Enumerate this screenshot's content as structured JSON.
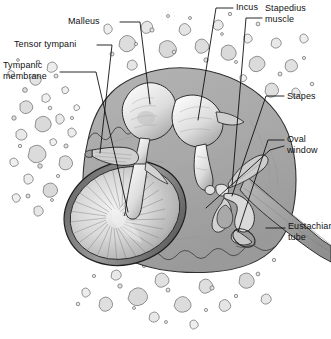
{
  "figure": {
    "width": 331,
    "height": 339,
    "background_color": "#ffffff",
    "line_color": "#111111",
    "cavity_fill": "#a9a9a9",
    "bone_fill": "#ffffff",
    "ossicle_fill": "#e8e8e8",
    "membrane_fill": "#d8d8d8"
  },
  "labels": [
    {
      "id": "tympanic-membrane",
      "text": "Tympanic\nmembrane",
      "line1": "Tympanic",
      "line2": "membrane",
      "x": 3,
      "y": 62,
      "align": "left"
    },
    {
      "id": "tensor-tympani",
      "text": "Tensor  tympani",
      "line1": "Tensor  tympani",
      "line2": "",
      "x": 14,
      "y": 41,
      "align": "left"
    },
    {
      "id": "malleus",
      "text": "Malleus",
      "line1": "Malleus",
      "line2": "",
      "x": 68,
      "y": 17,
      "align": "left"
    },
    {
      "id": "incus",
      "text": "Incus",
      "line1": "Incus",
      "line2": "",
      "x": 236,
      "y": 2,
      "align": "left"
    },
    {
      "id": "stapedius-muscle",
      "text": "Stapedius\nmuscle",
      "line1": "Stapedius",
      "line2": "muscle",
      "x": 264,
      "y": 3,
      "align": "left"
    },
    {
      "id": "stapes",
      "text": "Stapes",
      "line1": "Stapes",
      "line2": "",
      "x": 287,
      "y": 92,
      "align": "left"
    },
    {
      "id": "oval-window",
      "text": "Oval\nwindow",
      "line1": "Oval",
      "line2": "window",
      "x": 287,
      "y": 134,
      "align": "left"
    },
    {
      "id": "eustachian-tube",
      "text": "Eustachian\ntube",
      "line1": "Eustachian",
      "line2": "tube",
      "x": 288,
      "y": 221,
      "align": "left"
    }
  ],
  "structures": [
    {
      "id": "tympanic-membrane",
      "name": "Tympanic membrane"
    },
    {
      "id": "tensor-tympani",
      "name": "Tensor tympani"
    },
    {
      "id": "malleus",
      "name": "Malleus"
    },
    {
      "id": "incus",
      "name": "Incus"
    },
    {
      "id": "stapedius-muscle",
      "name": "Stapedius muscle"
    },
    {
      "id": "stapes",
      "name": "Stapes"
    },
    {
      "id": "oval-window",
      "name": "Oval window"
    },
    {
      "id": "eustachian-tube",
      "name": "Eustachian tube"
    },
    {
      "id": "temporal-bone",
      "name": "Temporal bone (cancellous)"
    },
    {
      "id": "middle-ear-cavity",
      "name": "Middle ear cavity"
    }
  ]
}
